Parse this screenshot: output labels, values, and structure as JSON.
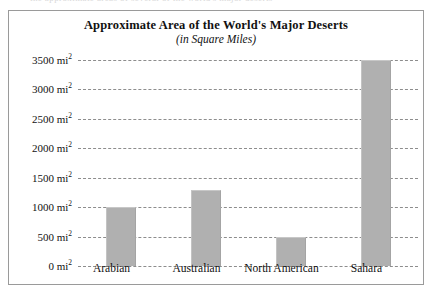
{
  "page": {
    "cutoff_text_above_frame": "the approximate areas of several of the world's major deserts"
  },
  "chart_data": {
    "type": "bar",
    "title": "Approximate Area of the World's Major Deserts",
    "subtitle": "(in Square Miles)",
    "categories": [
      "Arabian",
      "Australian",
      "North American",
      "Sahara"
    ],
    "values": [
      1000,
      1300,
      500,
      3500
    ],
    "value_unit": "mi2",
    "xlabel": "",
    "ylabel": "",
    "ylim": [
      0,
      3500
    ],
    "ytick_step": 500,
    "ytick_labels": [
      "3500 mi",
      "3000 mi",
      "2500 mi",
      "2000 mi",
      "1500 mi",
      "1000 mi",
      "500 mi",
      "0 mi"
    ],
    "ytick_values": [
      3500,
      3000,
      2500,
      2000,
      1500,
      1000,
      500,
      0
    ],
    "ytick_exponent": "2",
    "grid": true,
    "grid_style": "dashed",
    "legend": false,
    "legend_position": "none",
    "colors": {
      "bar_fill": "#b0b0b0",
      "bar_top_edge": "#c7c7c7",
      "gridline": "#8d8d8d",
      "frame_border": "#9a9a9a",
      "background": "#ffffff",
      "text": "#111111"
    }
  }
}
